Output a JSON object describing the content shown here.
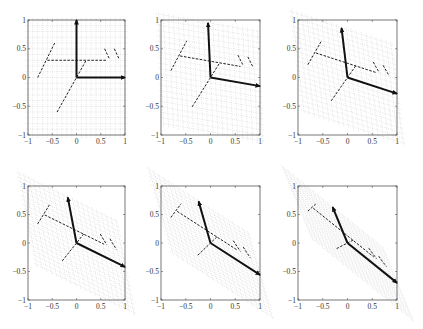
{
  "figure": {
    "xticks": [
      "-1",
      "-0.5",
      "0",
      "0.5",
      "1"
    ],
    "yticks": [
      "1",
      "0.5",
      "0",
      "-0.5",
      "-1"
    ],
    "xlim": [
      -1,
      1
    ],
    "ylim": [
      -1,
      1
    ]
  },
  "chart_data": {
    "type": "line",
    "title": "",
    "xlabel": "",
    "ylabel": "",
    "xlim": [
      -1,
      1
    ],
    "ylim": [
      -1,
      1
    ],
    "grid": true,
    "shape_original": [
      [
        [
          -0.6,
          0.3
        ],
        [
          0.62,
          0.3
        ]
      ],
      [
        [
          -0.8,
          0.0
        ],
        [
          -0.45,
          0.6
        ]
      ],
      [
        [
          -0.4,
          -0.6
        ],
        [
          0.2,
          0.3
        ]
      ],
      [
        [
          0.58,
          0.5
        ],
        [
          0.68,
          0.32
        ]
      ],
      [
        [
          0.78,
          0.5
        ],
        [
          0.88,
          0.32
        ]
      ]
    ],
    "panels": [
      {
        "label": "panel-1",
        "e1": [
          1.0,
          0.0
        ],
        "e2": [
          0.0,
          1.0
        ]
      },
      {
        "label": "panel-2",
        "e1": [
          1.0,
          -0.15
        ],
        "e2": [
          -0.05,
          0.95
        ]
      },
      {
        "label": "panel-3",
        "e1": [
          1.0,
          -0.28
        ],
        "e2": [
          -0.12,
          0.86
        ]
      },
      {
        "label": "panel-4",
        "e1": [
          1.0,
          -0.42
        ],
        "e2": [
          -0.18,
          0.8
        ]
      },
      {
        "label": "panel-5",
        "e1": [
          1.0,
          -0.56
        ],
        "e2": [
          -0.24,
          0.73
        ]
      },
      {
        "label": "panel-6",
        "e1": [
          1.0,
          -0.7
        ],
        "e2": [
          -0.3,
          0.63
        ]
      }
    ]
  },
  "layout": {
    "cols": [
      [
        28,
        125
      ],
      [
        161,
        260
      ],
      [
        298,
        397
      ]
    ],
    "rows": [
      [
        20,
        135
      ],
      [
        186,
        300
      ]
    ]
  },
  "colors": {
    "grid": "#c8c8c8",
    "shape": "#222222",
    "basis": "#111111",
    "frame": "#555555"
  }
}
